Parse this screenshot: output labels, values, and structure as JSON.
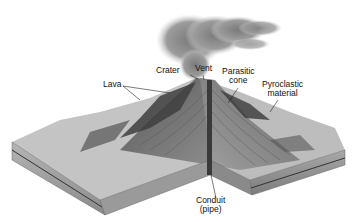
{
  "diagram": {
    "labels": {
      "crater": "Crater",
      "vent": "Vent",
      "lava": "Lava",
      "parasitic_cone_1": "Parasitic",
      "parasitic_cone_2": "cone",
      "pyroclastic_1": "Pyroclastic",
      "pyroclastic_2": "material",
      "conduit_1": "Conduit",
      "conduit_2": "(pipe)"
    },
    "colors": {
      "background": "#ffffff",
      "plume": "#8a8a8a",
      "surface_light": "#c8c8c8",
      "surface_dark": "#4a4a4a",
      "side_face": "#9a9a9a",
      "conduit": "#3a3a3a",
      "label_text": "#111111"
    }
  }
}
